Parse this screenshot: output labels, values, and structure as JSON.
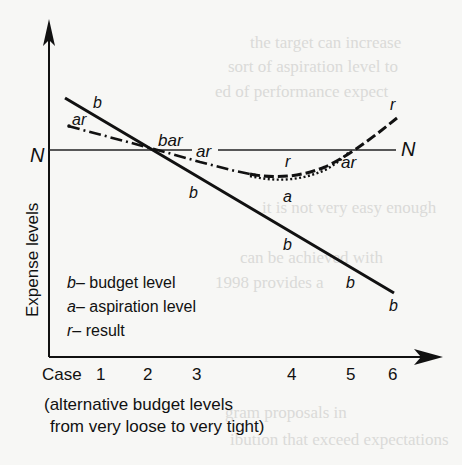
{
  "figure": {
    "y_axis_label": "Expense levels",
    "x_axis_start_label": "Case",
    "x_ticks": [
      "1",
      "2",
      "3",
      "4",
      "5",
      "6"
    ],
    "x_caption_line1": "(alternative budget levels",
    "x_caption_line2": "from very loose to very tight)",
    "norm_label_left": "N",
    "norm_label_right": "N",
    "legend": [
      {
        "symbol": "b",
        "text": "– budget level"
      },
      {
        "symbol": "a",
        "text": "– aspiration level"
      },
      {
        "symbol": "r",
        "text": "– result"
      }
    ],
    "curve_labels": {
      "b_top": "b",
      "ar_left": "ar",
      "bar_cross": "bar",
      "ar_mid": "ar",
      "b_mid": "b",
      "r_mid": "r",
      "a_mid": "a",
      "ar_right": "ar",
      "r_right": "r",
      "b_lower1": "b",
      "b_lower2": "b",
      "b_end": "b"
    },
    "colors": {
      "ink": "#111111",
      "background": "#f7f7f5",
      "ghost_text": "#d8d8d6"
    }
  }
}
